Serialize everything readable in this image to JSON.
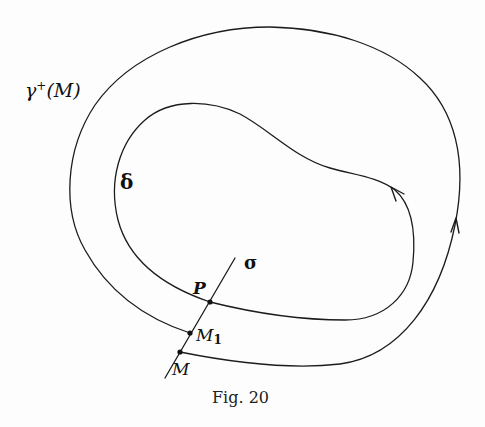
{
  "figure": {
    "caption": "Fig. 20",
    "labels": {
      "outer_orbit": "γ",
      "outer_orbit_sup": "+",
      "outer_orbit_arg": "(M)",
      "inner_cycle": "δ",
      "transversal": "σ",
      "point_P": "P",
      "point_M1_base": "M",
      "point_M1_sub": "1",
      "point_M": "M"
    },
    "elements": [
      {
        "id": "gamma-plus-M",
        "type": "curve",
        "description": "Positive half-trajectory spiralling from M around and returning to M1 on the transversal",
        "direction_arrow": "up along right side"
      },
      {
        "id": "delta",
        "type": "closed-curve",
        "description": "Inner kidney-shaped limit cycle passing through P",
        "direction_arrow": "counter-clockwise near upper right"
      },
      {
        "id": "sigma",
        "type": "line-segment",
        "description": "Transversal segment through M, M1 and P"
      },
      {
        "id": "M",
        "type": "point"
      },
      {
        "id": "M1",
        "type": "point"
      },
      {
        "id": "P",
        "type": "point"
      }
    ],
    "colors": {
      "stroke": "#1c1c1c",
      "background": "#fdfdfd"
    }
  }
}
